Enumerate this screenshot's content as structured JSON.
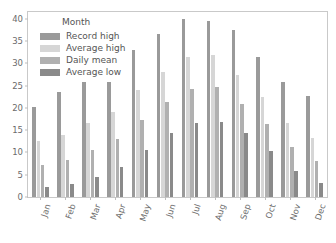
{
  "chart_data": {
    "type": "bar",
    "title": "",
    "xlabel": "",
    "ylabel": "",
    "ylim": [
      0,
      41.5
    ],
    "yticks": [
      0,
      5,
      10,
      15,
      20,
      25,
      30,
      35,
      40
    ],
    "ytick_labels": [
      "0",
      "5",
      "10",
      "15",
      "20",
      "25",
      "30",
      "35",
      "40"
    ],
    "grid": false,
    "legend_position": "upper left",
    "legend_title": "Month",
    "categories": [
      "Jan",
      "Feb",
      "Mar",
      "Apr",
      "May",
      "Jun",
      "Jul",
      "Aug",
      "Sep",
      "Oct",
      "Nov",
      "Dec"
    ],
    "series": [
      {
        "name": "Record high",
        "color": "#9a9a9a",
        "values": [
          20.1,
          23.5,
          25.7,
          25.7,
          33.0,
          36.6,
          40.0,
          39.5,
          37.4,
          31.3,
          25.9,
          22.7
        ]
      },
      {
        "name": "Average high",
        "color": "#d6d6d6",
        "values": [
          12.5,
          14.0,
          16.5,
          19.1,
          24.0,
          28.1,
          31.5,
          31.9,
          27.3,
          22.4,
          16.5,
          13.2
        ]
      },
      {
        "name": "Daily mean",
        "color": "#b0b0b0",
        "values": [
          7.2,
          8.3,
          10.5,
          13.0,
          17.3,
          21.3,
          24.2,
          24.6,
          20.8,
          16.3,
          11.2,
          8.1
        ]
      },
      {
        "name": "Average low",
        "color": "#8a8a8a",
        "values": [
          2.2,
          2.9,
          4.4,
          6.8,
          10.6,
          14.3,
          16.7,
          16.9,
          14.3,
          10.4,
          5.8,
          3.2
        ]
      }
    ]
  },
  "axes": {
    "ytick_labels": [
      "0",
      "5",
      "10",
      "15",
      "20",
      "25",
      "30",
      "35",
      "40"
    ],
    "xtick_labels": [
      "Jan",
      "Feb",
      "Mar",
      "Apr",
      "May",
      "Jun",
      "Jul",
      "Aug",
      "Sep",
      "Oct",
      "Nov",
      "Dec"
    ]
  },
  "legend": {
    "title": "Month",
    "items": [
      {
        "label": "Record high",
        "color": "#9a9a9a"
      },
      {
        "label": "Average high",
        "color": "#d6d6d6"
      },
      {
        "label": "Daily mean",
        "color": "#b0b0b0"
      },
      {
        "label": "Average low",
        "color": "#8a8a8a"
      }
    ]
  },
  "style": {
    "axis_color": "#c9c9c9",
    "tick_label_color": "#6b6b6b",
    "legend_text_color": "#555555",
    "background": "#ffffff"
  }
}
